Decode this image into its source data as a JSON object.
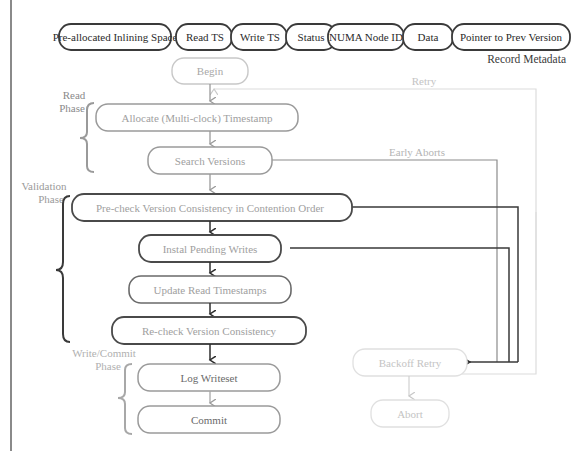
{
  "record_metadata": {
    "caption": "Record Metadata",
    "fields": [
      {
        "label": "Pre-allocated Inlining Space"
      },
      {
        "label": "Read TS"
      },
      {
        "label": "Write TS"
      },
      {
        "label": "Status"
      },
      {
        "label": "NUMA Node ID"
      },
      {
        "label": "Data"
      },
      {
        "label": "Pointer to Prev Version"
      }
    ]
  },
  "phases": {
    "read": {
      "line1": "Read",
      "line2": "Phase"
    },
    "validation": {
      "line1": "Validation",
      "line2": "Phase"
    },
    "write_commit": {
      "line1": "Write/Commit",
      "line2": "Phase"
    }
  },
  "nodes": {
    "begin": "Begin",
    "allocate": "Allocate (Multi-clock) Timestamp",
    "search": "Search Versions",
    "precheck": "Pre-check Version Consistency in Contention Order",
    "install": "Instal Pending Writes",
    "update": "Update Read Timestamps",
    "recheck": "Re-check Version Consistency",
    "log": "Log Writeset",
    "commit": "Commit",
    "backoff": "Backoff Retry",
    "abort": "Abort"
  },
  "edge_labels": {
    "retry": "Retry",
    "early_aborts": "Early Aborts"
  },
  "colors": {
    "dark_stroke": "#3a3a3a",
    "mid_stroke": "#8c8c8c",
    "light_stroke": "#c8c8c8",
    "faint_stroke": "#dcdcdc",
    "light_text": "#a8a8a8",
    "faint_text": "#c4c4c4"
  }
}
